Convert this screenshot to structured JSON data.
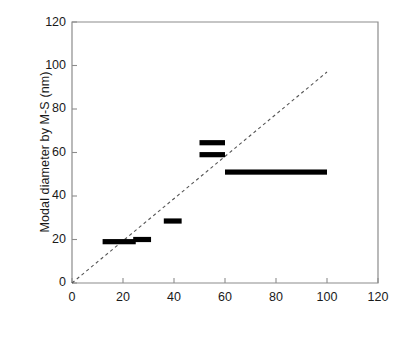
{
  "chart_data": {
    "type": "scatter",
    "title": "",
    "xlabel": "Typical diameter by EM (nm)",
    "ylabel": "Modal diameter by M-S (nm)",
    "xlim": [
      0,
      120
    ],
    "ylim": [
      0,
      120
    ],
    "xticks": [
      0,
      20,
      40,
      60,
      80,
      100,
      120
    ],
    "yticks": [
      0,
      20,
      40,
      60,
      80,
      100,
      120
    ],
    "grid": false,
    "legend": null,
    "marker_style": "horizontal-range-bar",
    "series": [
      {
        "name": "Samples",
        "points": [
          {
            "label": "bar-1",
            "x_start": 12,
            "x_end": 25,
            "y": 19
          },
          {
            "label": "bar-2",
            "x_start": 24,
            "x_end": 31,
            "y": 20
          },
          {
            "label": "bar-3",
            "x_start": 36,
            "x_end": 43,
            "y": 28.5
          },
          {
            "label": "bar-4",
            "x_start": 50,
            "x_end": 60,
            "y": 64.5
          },
          {
            "label": "bar-5",
            "x_start": 50,
            "x_end": 60,
            "y": 59
          },
          {
            "label": "bar-6",
            "x_start": 60,
            "x_end": 100,
            "y": 51
          }
        ]
      }
    ],
    "reference_line": {
      "name": "1:1 parity line",
      "style": "dashed",
      "color": "#555555",
      "x": [
        0,
        100
      ],
      "y": [
        0,
        97
      ]
    },
    "axis_color": "#8c8c8c",
    "data_color": "#000000"
  },
  "axes": {
    "y_tick_labels": [
      "120",
      "100",
      "80",
      "60",
      "40",
      "20",
      "0"
    ],
    "x_tick_labels": [
      "0",
      "20",
      "40",
      "60",
      "80",
      "100",
      "120"
    ],
    "y_title": "Modal diameter by M-S (nm)",
    "x_title": "Typical diameter by EM (nm)"
  }
}
